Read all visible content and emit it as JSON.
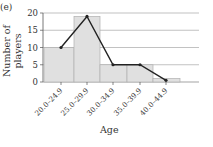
{
  "panel_label": "(e)",
  "chart_data": {
    "type": "bar",
    "title": "",
    "xlabel": "Age",
    "ylabel": "Number of players",
    "categories": [
      "20.0–24.9",
      "25.0–29.9",
      "30.0–34.9",
      "35.0–39.9",
      "40.0–44.9"
    ],
    "series": [
      {
        "name": "Histogram",
        "type": "bar",
        "values": [
          10,
          19,
          5,
          5,
          1
        ]
      },
      {
        "name": "Frequency polygon",
        "type": "line",
        "values": [
          10,
          19,
          5,
          5,
          0.5
        ]
      }
    ],
    "ylim": [
      0,
      20
    ],
    "yticks": [
      0,
      5,
      10,
      15,
      20
    ],
    "grid": true,
    "colors": {
      "bar_fill": "#e0e0e0",
      "bar_edge": "#b0b0b0",
      "line": "#222222",
      "grid": "#999999"
    }
  }
}
